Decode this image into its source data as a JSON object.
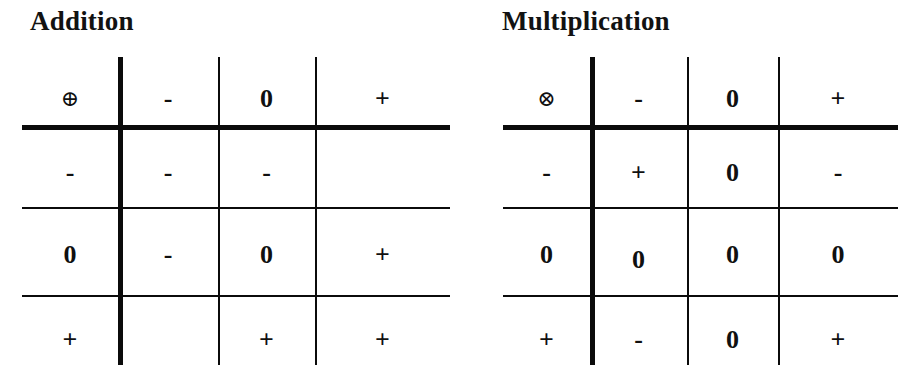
{
  "figure": {
    "kind": "sign-algebra-operation-tables",
    "tables": [
      {
        "id": "addition",
        "title": "Addition",
        "operator_symbol": "⊕",
        "operator_name": "circled-plus",
        "column_headers": [
          "-",
          "0",
          "+"
        ],
        "row_headers": [
          "-",
          "0",
          "+"
        ],
        "rows": [
          {
            "header": "-",
            "cells": [
              "-",
              "-",
              ""
            ]
          },
          {
            "header": "0",
            "cells": [
              "-",
              "0",
              "+"
            ]
          },
          {
            "header": "+",
            "cells": [
              "",
              "+",
              "+"
            ]
          }
        ]
      },
      {
        "id": "multiplication",
        "title": "Multiplication",
        "operator_symbol": "⊗",
        "operator_name": "circled-times",
        "column_headers": [
          "-",
          "0",
          "+"
        ],
        "row_headers": [
          "-",
          "0",
          "+"
        ],
        "rows": [
          {
            "header": "-",
            "cells": [
              "+",
              "0",
              "-"
            ]
          },
          {
            "header": "0",
            "cells": [
              "0",
              "0",
              "0"
            ]
          },
          {
            "header": "+",
            "cells": [
              "-",
              "0",
              "+"
            ]
          }
        ]
      }
    ],
    "colors": {
      "background": "#ffffff",
      "ink": "#0b0b0b"
    }
  }
}
